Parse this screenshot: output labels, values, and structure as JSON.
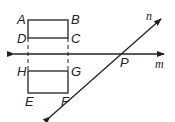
{
  "diagram": {
    "points": {
      "A": "A",
      "B": "B",
      "C": "C",
      "D": "D",
      "E": "E",
      "F": "F",
      "G": "G",
      "H": "H",
      "P": "P"
    },
    "lines": {
      "m": "m",
      "n": "n"
    },
    "colors": {
      "stroke": "#222222",
      "background": "#ffffff"
    }
  }
}
